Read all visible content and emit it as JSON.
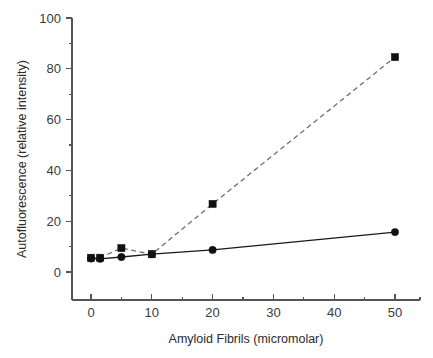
{
  "chart_data": {
    "type": "scatter",
    "title": "",
    "xlabel": "Amyloid Fibrils (micromolar)",
    "ylabel": "Autofluorescence (relative intensity)",
    "xlim": [
      -3,
      54
    ],
    "ylim": [
      0,
      100
    ],
    "grid": false,
    "legend": "none",
    "x_ticks": [
      0,
      10,
      20,
      30,
      40,
      50
    ],
    "x_tick_labels": [
      "0",
      "10",
      "20",
      "30",
      "40",
      "50"
    ],
    "x_minor_ticks": [
      5,
      15,
      25,
      35,
      45
    ],
    "y_ticks": [
      0,
      20,
      40,
      60,
      80,
      100
    ],
    "y_tick_labels": [
      "0",
      "20",
      "40",
      "60",
      "80",
      "100"
    ],
    "y_minor_ticks": [
      10,
      30,
      50,
      70,
      90
    ],
    "series": [
      {
        "name": "squares-dashed",
        "marker": "square",
        "linestyle": "dashed",
        "color": "#111111",
        "line_color": "#6f6f6f",
        "x": [
          0,
          1.5,
          5,
          10,
          20,
          50
        ],
        "values": [
          5.6,
          5.6,
          9.4,
          7.0,
          26.8,
          84.6
        ]
      },
      {
        "name": "circles-solid",
        "marker": "circle",
        "linestyle": "solid",
        "color": "#111111",
        "line_color": "#1a1a1a",
        "x": [
          0,
          1.5,
          5,
          10,
          20,
          50
        ],
        "values": [
          5.3,
          5.2,
          5.9,
          7.0,
          8.7,
          15.7
        ]
      }
    ]
  },
  "figure": {
    "background_color": "#ffffff",
    "axis_color": "#555555",
    "text_color": "#2b2b2b"
  }
}
